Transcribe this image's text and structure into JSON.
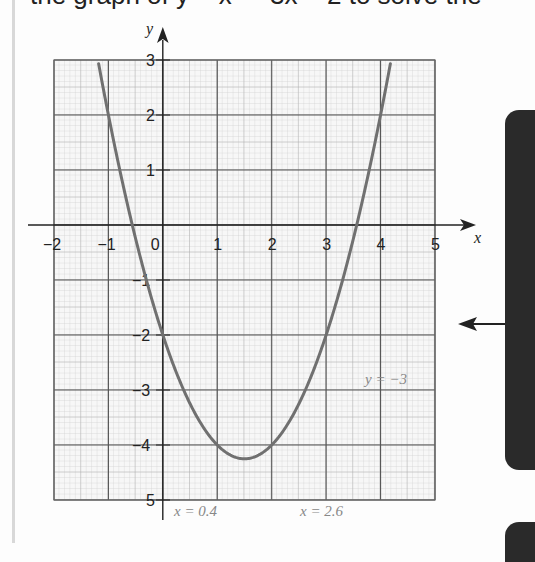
{
  "page": {
    "top_text_fragment": "the graph of y = x² − 3x − 2 to solve the equation",
    "arrow_direction": "left"
  },
  "chart_data": {
    "type": "line",
    "title": "",
    "function": "y = x^2 - 3x - 2",
    "xlabel": "x",
    "ylabel": "y",
    "xlim": [
      -2,
      5
    ],
    "ylim": [
      -5,
      3
    ],
    "grid": true,
    "grid_minor_per_unit": 10,
    "x_ticks": [
      "−2",
      "−1",
      "0",
      "1",
      "2",
      "3",
      "4",
      "5"
    ],
    "y_ticks": [
      "3",
      "2",
      "1",
      "−1",
      "−2",
      "−3",
      "−4",
      "5"
    ],
    "series": [
      {
        "name": "y = x² − 3x − 2",
        "x": [
          -1.2,
          -1.0,
          -0.5,
          0,
          0.5,
          1.0,
          1.5,
          2.0,
          2.5,
          3.0,
          3.5,
          4.0,
          4.2
        ],
        "y": [
          3.04,
          2.0,
          -0.25,
          -2.0,
          -3.25,
          -4.0,
          -4.25,
          -4.0,
          -3.25,
          -2.0,
          -0.25,
          2.0,
          3.04
        ]
      }
    ],
    "annotations": [
      {
        "text": "y = −3",
        "x": 4.2,
        "y": -2.8
      },
      {
        "text": "x = 0.4",
        "x": 0.2,
        "y": -5.2
      },
      {
        "text": "x = 2.6",
        "x": 2.5,
        "y": -5.2
      }
    ],
    "colors": {
      "curve": "#707070",
      "grid_major": "#555555",
      "grid_minor": "#c8c8c8",
      "axis": "#222222",
      "annotation": "#888888"
    }
  }
}
